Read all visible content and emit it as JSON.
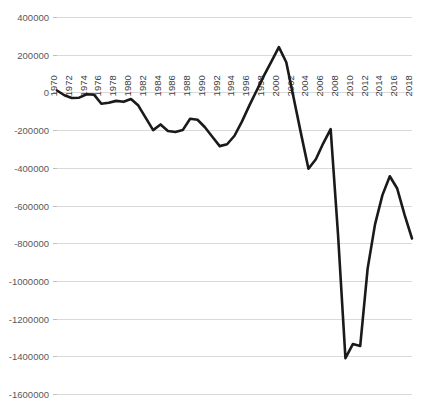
{
  "chart_data": {
    "type": "line",
    "title": "",
    "subtitle": "",
    "xlabel": "",
    "ylabel": "",
    "grid": true,
    "legend": false,
    "legend_position": "none",
    "xlim": [
      1970,
      2018
    ],
    "ylim": [
      -1600000,
      400000
    ],
    "ytick_labels": [
      "400000",
      "200000",
      "0",
      "-200000",
      "-400000",
      "-600000",
      "-800000",
      "-1000000",
      "-1200000",
      "-1400000",
      "-1600000"
    ],
    "ytick_values": [
      400000,
      200000,
      0,
      -200000,
      -400000,
      -600000,
      -800000,
      -1000000,
      -1200000,
      -1400000,
      -1600000
    ],
    "xtick_labels": [
      "1970",
      "1972",
      "1974",
      "1976",
      "1978",
      "1980",
      "1982",
      "1984",
      "1986",
      "1988",
      "1990",
      "1992",
      "1994",
      "1996",
      "1998",
      "2000",
      "2002",
      "2004",
      "2006",
      "2008",
      "2010",
      "2012",
      "2014",
      "2016",
      "2018"
    ],
    "series": [
      {
        "name": "series-1",
        "color": "#1a1a1a",
        "x": [
          1970,
          1971,
          1972,
          1973,
          1974,
          1975,
          1976,
          1977,
          1978,
          1979,
          1980,
          1981,
          1982,
          1983,
          1984,
          1985,
          1986,
          1987,
          1988,
          1989,
          1990,
          1991,
          1992,
          1993,
          1994,
          1995,
          1996,
          1997,
          1998,
          1999,
          2000,
          2001,
          2002,
          2003,
          2004,
          2005,
          2006,
          2007,
          2008,
          2009,
          2010,
          2011,
          2012,
          2013,
          2014,
          2015,
          2016,
          2017,
          2018
        ],
        "values": [
          10000,
          -15000,
          -30000,
          -28000,
          -10000,
          -12000,
          -60000,
          -55000,
          -45000,
          -50000,
          -35000,
          -70000,
          -135000,
          -200000,
          -170000,
          -205000,
          -210000,
          -200000,
          -140000,
          -145000,
          -185000,
          -235000,
          -285000,
          -275000,
          -230000,
          -155000,
          -70000,
          10000,
          90000,
          165000,
          240000,
          160000,
          -30000,
          -220000,
          -405000,
          -355000,
          -270000,
          -195000,
          -755000,
          -1410000,
          -1335000,
          -1345000,
          -935000,
          -700000,
          -545000,
          -445000,
          -510000,
          -650000,
          -775000
        ]
      }
    ]
  },
  "axes": {
    "plot_left_px": 57,
    "plot_right_px": 412,
    "zero_line_value": "0"
  }
}
